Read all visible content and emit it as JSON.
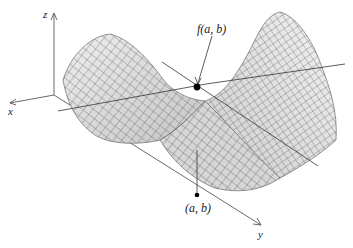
{
  "figure": {
    "type": "saddle-surface-3d",
    "axes": {
      "x_label": "x",
      "y_label": "y",
      "z_label": "z"
    },
    "labels": {
      "point_on_surface": "f(a, b)",
      "point_on_plane": "(a, b)"
    },
    "colors": {
      "surface_fill": "#d9d9d9",
      "grid_lines": "#3a3a3a",
      "axes": "#444444",
      "point": "#000000"
    }
  }
}
